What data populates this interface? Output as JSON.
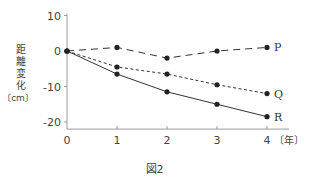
{
  "chart_data": {
    "type": "line",
    "title": "",
    "caption": "図2",
    "xlabel": "〔年〕",
    "ylabel": "距離変化〔cm〕",
    "ylabel_chars": [
      "距",
      "離",
      "変",
      "化"
    ],
    "ylabel_unit": "〔cm〕",
    "x": [
      0,
      1,
      2,
      3,
      4
    ],
    "x_ticks": [
      "0",
      "1",
      "2",
      "3",
      "4"
    ],
    "y_ticks": [
      "10",
      "0",
      "-10",
      "-20"
    ],
    "ylim": [
      -22,
      10
    ],
    "xlim": [
      0,
      4.5
    ],
    "grid": false,
    "legend": "inline labels at line ends",
    "series": [
      {
        "name": "P",
        "style": "long-dash",
        "values": [
          0,
          1,
          -2,
          0,
          1
        ]
      },
      {
        "name": "Q",
        "style": "short-dash",
        "values": [
          0,
          -4.5,
          -6.5,
          -9.5,
          -12
        ]
      },
      {
        "name": "R",
        "style": "solid",
        "values": [
          0,
          -6.5,
          -11.5,
          -15,
          -18.5
        ]
      }
    ]
  },
  "colors": {
    "line": "#333333",
    "axis": "#999999",
    "text": "#444444"
  }
}
